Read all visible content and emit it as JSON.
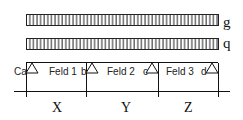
{
  "loads": [
    {
      "label": "g",
      "type": "uniform-distributed"
    },
    {
      "label": "q",
      "type": "uniform-distributed"
    }
  ],
  "supports": [
    {
      "label": "Ca",
      "type": "pin"
    },
    {
      "label": "b",
      "type": "roller"
    },
    {
      "label": "c",
      "type": "roller"
    },
    {
      "label": "d",
      "type": "roller"
    }
  ],
  "spans": [
    {
      "label": "Feld 1",
      "dimension": "X"
    },
    {
      "label": "Feld 2",
      "dimension": "Y"
    },
    {
      "label": "Feld 3",
      "dimension": "Z"
    }
  ],
  "colors": {
    "line": "#111111",
    "background": "#ffffff"
  }
}
